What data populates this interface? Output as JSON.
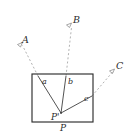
{
  "figure": {
    "kind": "geometry-diagram",
    "width": 140,
    "height": 139,
    "background_color": "#ffffff",
    "solid_line_color": "#3b3b3b",
    "dashed_line_color": "#a9a9a9",
    "rectangle_color": "#2e2e2e",
    "marker_color": "#8e8e8e"
  },
  "labels": {
    "point_a_upper": "A",
    "point_b_upper": "B",
    "point_c_upper": "C",
    "angle_a": "a",
    "angle_b": "b",
    "angle_c": "c",
    "point_p_prime": "P'",
    "surface_p": "P"
  },
  "geometry": {
    "rectangle": {
      "x": 32,
      "y": 74,
      "width": 61,
      "height": 48
    },
    "vertex_p_prime": {
      "x": 61,
      "y": 113
    },
    "ray_endpoints": {
      "a": {
        "x": 38,
        "y": 76
      },
      "b": {
        "x": 66,
        "y": 76
      },
      "c": {
        "x": 92,
        "y": 96
      }
    },
    "dashed_endpoints": {
      "A": {
        "x": 20,
        "y": 43
      },
      "B": {
        "x": 72,
        "y": 25
      },
      "C": {
        "x": 115,
        "y": 70
      }
    },
    "markers": [
      {
        "name": "A",
        "x": 19,
        "y": 42
      },
      {
        "name": "B",
        "x": 71,
        "y": 23
      },
      {
        "name": "C",
        "x": 114,
        "y": 69
      }
    ]
  }
}
